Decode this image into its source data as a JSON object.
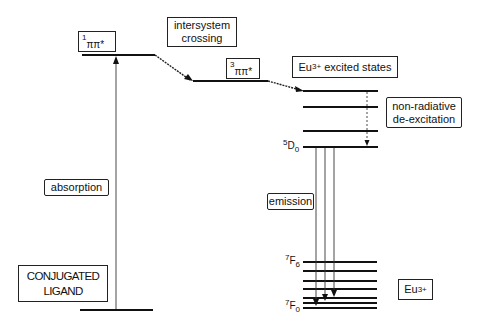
{
  "diagram": {
    "title": "",
    "type": "energy-level diagram (Jablonski / antenna effect)",
    "ligand": {
      "label": "CONJUGATED",
      "label2": "LIGAND",
      "singlet_state": {
        "sup": "1",
        "label": "ππ*"
      },
      "triplet_state": {
        "sup": "3",
        "label": "ππ*"
      }
    },
    "processes": {
      "absorption": "absorption",
      "isc_line1": "intersystem",
      "isc_line2": "crossing",
      "nonrad_line1": "non-radiative",
      "nonrad_line2": "de-excitation",
      "emission": "emission"
    },
    "europium": {
      "excited_label_pre": "Eu",
      "excited_label_sup": "3+",
      "excited_label_post": " excited states",
      "ion_label": "Eu",
      "ion_sup": "3+",
      "level_5d0": {
        "sup": "5",
        "main": "D",
        "sub": "0"
      },
      "level_7f6": {
        "sup": "7",
        "main": "F",
        "sub": "6"
      },
      "level_7f0": {
        "sup": "7",
        "main": "F",
        "sub": "0"
      }
    },
    "colors": {
      "line": "#111111",
      "background": "#ffffff"
    }
  }
}
